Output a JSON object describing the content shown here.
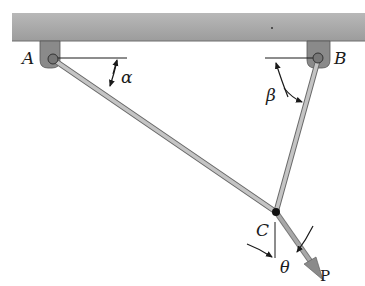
{
  "diagram": {
    "type": "statics-two-member-truss",
    "labels": {
      "support_a": "A",
      "support_b": "B",
      "joint_c": "C",
      "load": "P",
      "angle_alpha": "α",
      "angle_beta": "β",
      "angle_theta": "θ"
    },
    "colors": {
      "ceiling": "#a8a8a8",
      "ceiling_edge": "#6e6e6e",
      "bracket": "#8a8a8a",
      "member": "#b0b0b0",
      "member_edge": "#6a6a6a",
      "load_arrow": "#9a9a9a",
      "ink": "#1a1a1a"
    },
    "geometry": {
      "A": [
        50,
        34
      ],
      "B": [
        319,
        34
      ],
      "C": [
        276,
        212
      ],
      "P_tip": [
        322,
        279
      ]
    }
  }
}
